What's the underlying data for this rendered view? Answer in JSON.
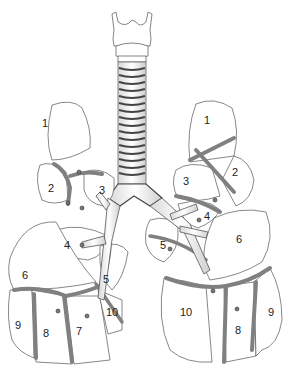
{
  "diagram": {
    "right_lung": {
      "segments": [
        {
          "label": "1",
          "x": 42,
          "y": 125
        },
        {
          "label": "2",
          "x": 48,
          "y": 190
        },
        {
          "label": "3",
          "x": 99,
          "y": 191
        },
        {
          "label": "4",
          "x": 64,
          "y": 243
        },
        {
          "label": "5",
          "x": 103,
          "y": 276
        },
        {
          "label": "6",
          "x": 22,
          "y": 273
        },
        {
          "label": "7",
          "x": 76,
          "y": 329
        },
        {
          "label": "8",
          "x": 43,
          "y": 331
        },
        {
          "label": "9",
          "x": 15,
          "y": 323
        },
        {
          "label": "10",
          "x": 106,
          "y": 309
        }
      ]
    },
    "left_lung": {
      "segments": [
        {
          "label": "1",
          "x": 204,
          "y": 120
        },
        {
          "label": "2",
          "x": 232,
          "y": 172
        },
        {
          "label": "3",
          "x": 183,
          "y": 181
        },
        {
          "label": "4",
          "x": 204,
          "y": 216
        },
        {
          "label": "5",
          "x": 160,
          "y": 243
        },
        {
          "label": "6",
          "x": 236,
          "y": 237
        },
        {
          "label": "8",
          "x": 235,
          "y": 328
        },
        {
          "label": "9",
          "x": 268,
          "y": 310
        },
        {
          "label": "10",
          "x": 180,
          "y": 309
        }
      ]
    },
    "colors": {
      "outline": "#555555",
      "vessel": "#808080",
      "fill": "#ffffff"
    }
  }
}
